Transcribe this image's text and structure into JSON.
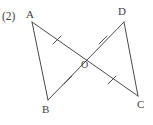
{
  "figure": {
    "item_number": "(2)",
    "background_color": "#ffffff",
    "stroke_color": "#4a4a4a",
    "label_color": "#3f3f3f",
    "stroke_width": 1,
    "width": 153,
    "height": 125,
    "type": "geometry-diagram",
    "vertices": [
      {
        "name": "A",
        "label": "A",
        "x": 32,
        "y": 22
      },
      {
        "name": "D",
        "label": "D",
        "x": 124,
        "y": 22
      },
      {
        "name": "B",
        "label": "B",
        "x": 48,
        "y": 100
      },
      {
        "name": "C",
        "label": "C",
        "x": 138,
        "y": 96
      },
      {
        "name": "O",
        "label": "O",
        "x": 82,
        "y": 58
      }
    ],
    "segments": [
      {
        "name": "segment-a-c",
        "from": "A",
        "to": "C",
        "path": "M32,22 L138,96"
      },
      {
        "name": "segment-d-b",
        "from": "D",
        "to": "B",
        "path": "M124,22 L48,100"
      },
      {
        "name": "segment-a-b",
        "from": "A",
        "to": "B",
        "path": "M32,22 L48,100"
      },
      {
        "name": "segment-d-c",
        "from": "D",
        "to": "C",
        "path": "M124,22 L138,96"
      }
    ],
    "tick_marks": [
      {
        "name": "tick-segment-a-o",
        "on": "AO",
        "path": "M53,44 L61,36"
      },
      {
        "name": "tick-segment-o-d",
        "on": "OD",
        "path": "M99,44 L107,36"
      },
      {
        "name": "tick-segment-b-o",
        "on": "BO",
        "path": "M64,84 L72,76"
      },
      {
        "name": "tick-segment-o-c",
        "on": "OC",
        "path": "M108,84 L116,76"
      }
    ]
  }
}
